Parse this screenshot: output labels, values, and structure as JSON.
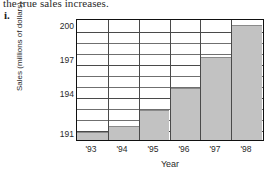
{
  "page": {
    "top_text": "the true sales increases.",
    "item_marker": "i."
  },
  "chart_data": {
    "type": "bar",
    "title": "",
    "xlabel": "Year",
    "ylabel": "Sales (millions of dollars)",
    "categories": [
      "'93",
      "'94",
      "'95",
      "'96",
      "'97",
      "'98"
    ],
    "values": [
      191,
      191.6,
      193,
      195,
      197.8,
      200.7
    ],
    "ylim": [
      190.3,
      201.1
    ],
    "ytick_labels": [
      "191",
      "194",
      "197",
      "200"
    ],
    "ytick_values": [
      191,
      194,
      197,
      200
    ],
    "minor_gridline_values": [
      191,
      192,
      193,
      194,
      195,
      196,
      197,
      198,
      199,
      200
    ],
    "grid": "horizontal-and-vertical",
    "legend": "none",
    "bar_fill_color": "#c2c2c2",
    "frame_color": "#111111",
    "gridline_color": "#6f6f6f",
    "background_color": "#ffffff"
  }
}
